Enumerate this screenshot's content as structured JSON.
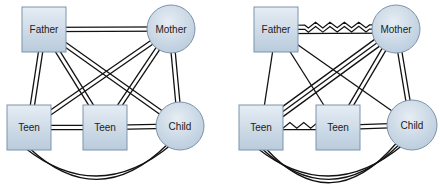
{
  "colors": {
    "node_fill_top": "#e6edf4",
    "node_fill_bottom": "#b9cbdc",
    "node_stroke": "#7d93aa",
    "edge": "#111111",
    "background": "#ffffff"
  },
  "diagrams": [
    {
      "id": "left",
      "nodes": [
        {
          "id": "father",
          "label": "Father",
          "shape": "rect",
          "x": 22,
          "y": 7,
          "w": 44,
          "h": 45
        },
        {
          "id": "mother",
          "label": "Mother",
          "shape": "circle",
          "cx": 171,
          "cy": 29,
          "r": 24
        },
        {
          "id": "teen1",
          "label": "Teen",
          "shape": "rect",
          "x": 7,
          "y": 105,
          "w": 44,
          "h": 45
        },
        {
          "id": "teen2",
          "label": "Teen",
          "shape": "rect",
          "x": 83,
          "y": 105,
          "w": 44,
          "h": 45
        },
        {
          "id": "child",
          "label": "Child",
          "shape": "circle",
          "cx": 180,
          "cy": 126,
          "r": 24
        }
      ],
      "edges": [
        {
          "from": "father",
          "to": "mother",
          "lines": [
            "straight",
            "straight"
          ]
        },
        {
          "from": "father",
          "to": "teen1",
          "lines": [
            "straight",
            "straight"
          ]
        },
        {
          "from": "father",
          "to": "teen2",
          "lines": [
            "straight",
            "straight"
          ]
        },
        {
          "from": "father",
          "to": "child",
          "lines": [
            "straight",
            "straight"
          ]
        },
        {
          "from": "mother",
          "to": "teen1",
          "lines": [
            "straight",
            "straight"
          ]
        },
        {
          "from": "mother",
          "to": "teen2",
          "lines": [
            "straight",
            "straight"
          ]
        },
        {
          "from": "mother",
          "to": "child",
          "lines": [
            "straight",
            "straight"
          ]
        },
        {
          "from": "teen1",
          "to": "teen2",
          "lines": [
            "straight",
            "straight"
          ]
        },
        {
          "from": "teen2",
          "to": "child",
          "lines": [
            "straight",
            "straight"
          ]
        },
        {
          "from": "teen1",
          "to": "child",
          "lines": [
            "arc",
            "arc"
          ]
        }
      ]
    },
    {
      "id": "right",
      "nodes": [
        {
          "id": "father",
          "label": "Father",
          "shape": "rect",
          "x": 254,
          "y": 7,
          "w": 44,
          "h": 45
        },
        {
          "id": "mother",
          "label": "Mother",
          "shape": "circle",
          "cx": 396,
          "cy": 29,
          "r": 24
        },
        {
          "id": "teen1",
          "label": "Teen",
          "shape": "rect",
          "x": 239,
          "y": 105,
          "w": 44,
          "h": 45
        },
        {
          "id": "teen2",
          "label": "Teen",
          "shape": "rect",
          "x": 316,
          "y": 105,
          "w": 44,
          "h": 45
        },
        {
          "id": "child",
          "label": "Child",
          "shape": "circle",
          "cx": 412,
          "cy": 125,
          "r": 25
        }
      ],
      "edges": [
        {
          "from": "father",
          "to": "mother",
          "lines": [
            "zigzag",
            "zigzag",
            "straight"
          ]
        },
        {
          "from": "father",
          "to": "teen1",
          "lines": [
            "straight"
          ]
        },
        {
          "from": "father",
          "to": "teen2",
          "lines": [
            "straight"
          ]
        },
        {
          "from": "father",
          "to": "child",
          "lines": [
            "straight"
          ]
        },
        {
          "from": "mother",
          "to": "teen1",
          "lines": [
            "straight",
            "straight",
            "straight"
          ]
        },
        {
          "from": "mother",
          "to": "teen2",
          "lines": [
            "straight",
            "straight"
          ]
        },
        {
          "from": "mother",
          "to": "child",
          "lines": [
            "straight",
            "straight"
          ]
        },
        {
          "from": "teen1",
          "to": "teen2",
          "lines": [
            "zigzag",
            "straight"
          ]
        },
        {
          "from": "teen2",
          "to": "child",
          "lines": [
            "straight",
            "straight"
          ]
        },
        {
          "from": "teen1",
          "to": "child",
          "lines": [
            "arc",
            "arc",
            "arc"
          ]
        }
      ]
    }
  ]
}
